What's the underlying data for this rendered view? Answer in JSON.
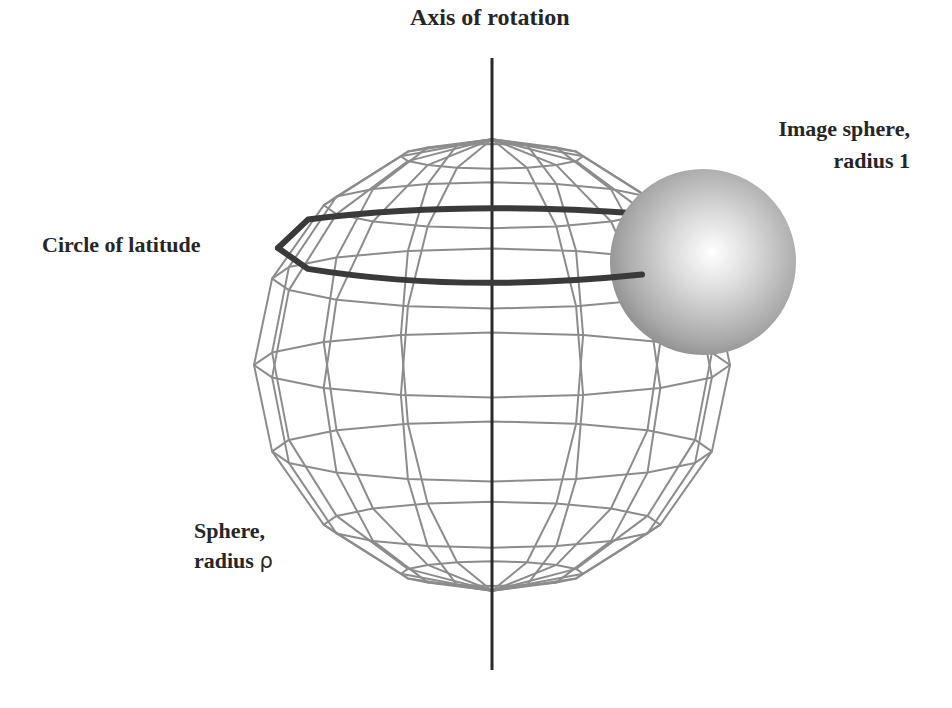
{
  "diagram": {
    "labels": {
      "axis": "Axis of rotation",
      "image_sphere_line1": "Image sphere,",
      "image_sphere_line2": "radius 1",
      "circle_of_latitude": "Circle of latitude",
      "sphere_line1": "Sphere,",
      "sphere_line2_text": "radius",
      "sphere_line2_symbol": "ρ"
    },
    "colors": {
      "background": "#ffffff",
      "text": "#262626",
      "axis": "#2a2a2a",
      "wireframe": "#8c8c8c",
      "latitude_circle": "#3a3a3a",
      "image_sphere_highlight": "#ffffff",
      "image_sphere_shadow": "#7a7a7a"
    },
    "geometry": {
      "axis": {
        "x": 492,
        "y_top": 58,
        "y_bottom": 670
      },
      "wire_sphere": {
        "cx": 492,
        "cy": 365,
        "rx": 238,
        "ry": 235,
        "meridians": 16,
        "parallels": 8
      },
      "latitude_circle": {
        "cx": 460,
        "cy": 248,
        "rx": 182,
        "ry": 38
      },
      "image_sphere": {
        "cx": 703,
        "cy": 262,
        "r": 93
      }
    }
  }
}
